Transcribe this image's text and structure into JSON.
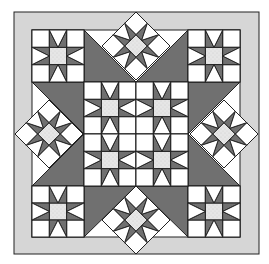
{
  "image": {
    "title": "Sawtooth Star Medallion Quilt",
    "width": 269,
    "height": 264
  },
  "colors": {
    "background": "#ffffff",
    "border": "#d6d6d6",
    "dark": "#707070",
    "light": "#e6e6e6",
    "white": "#ffffff",
    "line": "#222222"
  },
  "quilt": {
    "outer_border": {
      "x": 14,
      "y": 12,
      "w": 245,
      "h": 242
    },
    "inner_field": {
      "x": 32,
      "y": 30,
      "w": 208,
      "h": 207
    },
    "grid": {
      "cols": [
        32,
        84,
        136,
        188,
        240
      ],
      "rows": [
        30,
        82,
        134,
        186,
        237
      ]
    },
    "square_star_blocks": [
      {
        "name": "corner-top-left",
        "col": 0,
        "row": 0
      },
      {
        "name": "corner-top-right",
        "col": 3,
        "row": 0
      },
      {
        "name": "corner-bottom-left",
        "col": 0,
        "row": 3
      },
      {
        "name": "corner-bottom-right",
        "col": 3,
        "row": 3
      },
      {
        "name": "center-top-left",
        "col": 1,
        "row": 1
      },
      {
        "name": "center-top-right",
        "col": 2,
        "row": 1
      },
      {
        "name": "center-bottom-left",
        "col": 1,
        "row": 2
      },
      {
        "name": "center-bottom-right",
        "col": 2,
        "row": 2
      }
    ],
    "on_point_stars": [
      {
        "name": "top",
        "cx": 136,
        "cy": 46,
        "r": 34
      },
      {
        "name": "left",
        "cx": 49,
        "cy": 134,
        "r": 34
      },
      {
        "name": "right",
        "cx": 224,
        "cy": 134,
        "r": 34
      },
      {
        "name": "bottom",
        "cx": 136,
        "cy": 220,
        "r": 34
      }
    ],
    "dark_triangles": [
      {
        "name": "top-left",
        "points": "84,82 136,82 84,30"
      },
      {
        "name": "top-right",
        "points": "136,82 188,82 188,30"
      },
      {
        "name": "bottom-left",
        "points": "84,186 136,186 84,237"
      },
      {
        "name": "bottom-right",
        "points": "136,186 188,186 188,237"
      },
      {
        "name": "left-top",
        "points": "84,82 84,134 32,82"
      },
      {
        "name": "left-bottom",
        "points": "84,134 84,186 32,186"
      },
      {
        "name": "right-top",
        "points": "188,82 188,134 240,82"
      },
      {
        "name": "right-bottom",
        "points": "188,134 188,186 240,186"
      }
    ]
  }
}
